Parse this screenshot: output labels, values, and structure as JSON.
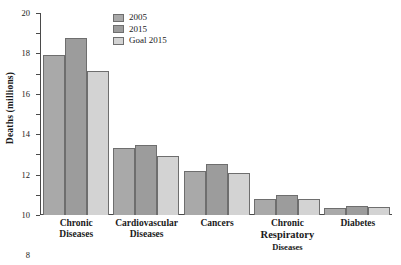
{
  "chart_data": {
    "type": "bar",
    "title": "",
    "xlabel": "",
    "ylabel": "Deaths (millions)",
    "ylim": [
      0,
      20
    ],
    "ytick_step": 2,
    "yticks": [
      "0",
      "2",
      "4",
      "6",
      "8",
      "10",
      "12",
      "14",
      "16",
      "18",
      "20"
    ],
    "grid": false,
    "legend_position": "top-center",
    "categories": [
      "Chronic Diseases",
      "Cardiovascular Diseases",
      "Cancers",
      "Chronic Respiratory Diseases",
      "Diabetes"
    ],
    "category_lines": [
      [
        "Chronic",
        "Diseases",
        ""
      ],
      [
        "Cardiovascular",
        "Diseases",
        ""
      ],
      [
        "Cancers",
        "",
        ""
      ],
      [
        "Chronic",
        "Respiratory",
        "Diseases"
      ],
      [
        "Diabetes",
        "",
        ""
      ]
    ],
    "series": [
      {
        "name": "2005",
        "color": "#a9a9a9",
        "values": [
          15.8,
          6.6,
          4.35,
          1.6,
          0.65
        ]
      },
      {
        "name": "2015",
        "color": "#9c9c9c",
        "values": [
          17.5,
          6.9,
          5.05,
          1.95,
          0.9
        ]
      },
      {
        "name": "Goal 2015",
        "color": "#d3d3d3",
        "values": [
          14.3,
          5.8,
          4.15,
          1.6,
          0.75
        ]
      }
    ]
  },
  "colors": {
    "axis": "#4a4a4a",
    "bar_outline": "#6e6e6e",
    "background": "#ffffff",
    "text": "#1a1a1a"
  }
}
